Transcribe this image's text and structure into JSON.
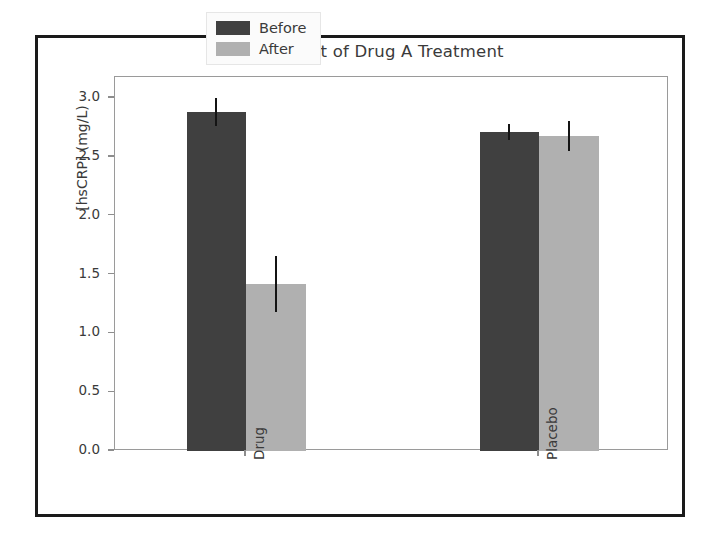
{
  "chart_data": {
    "type": "bar",
    "title": "Effect of Drug A Treatment",
    "xlabel": "",
    "ylabel": "[hsCRP] (mg/L)",
    "categories": [
      "Drug",
      "Placebo"
    ],
    "series": [
      {
        "name": "Before",
        "color": "#404040",
        "values": [
          2.88,
          2.71
        ],
        "errors": [
          0.12,
          0.07
        ]
      },
      {
        "name": "After",
        "color": "#b0b0b0",
        "values": [
          1.42,
          2.68
        ],
        "errors": [
          0.24,
          0.13
        ]
      }
    ],
    "ylim": [
      0.0,
      3.18
    ],
    "yticks": [
      0.0,
      0.5,
      1.0,
      1.5,
      2.0,
      2.5,
      3.0
    ],
    "ytick_labels": [
      "0.0",
      "0.5",
      "1.0",
      "1.5",
      "2.0",
      "2.5",
      "3.0"
    ],
    "xtick_label_rotation": 90,
    "grid": false,
    "legend_position": "upper center",
    "error_bar_style": "line",
    "frame_color": "#9a9a9a",
    "outer_border_color": "#1a1a1a",
    "background_color": "#ffffff",
    "text_color": "#3a3a3a"
  }
}
